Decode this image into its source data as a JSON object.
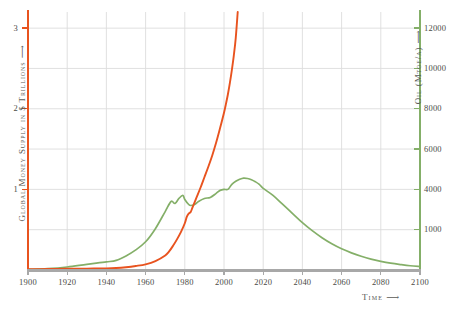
{
  "chart_data": {
    "type": "line",
    "title": "",
    "xlabel": "Time ⟶",
    "grid": true,
    "legend": "none",
    "xlim": [
      1900,
      2100
    ],
    "x_ticks": [
      "1900",
      "1920",
      "1940",
      "1960",
      "1980",
      "2000",
      "2020",
      "2040",
      "2060",
      "2080",
      "2100"
    ],
    "x_tick_values": [
      1900,
      1920,
      1940,
      1960,
      1980,
      2000,
      2020,
      2040,
      2060,
      2080,
      2100
    ],
    "axes": [
      {
        "id": "left",
        "label": "Global Money Supply in $ Trillions ⟶",
        "color": "#E8531F",
        "ylim": [
          0,
          3.2
        ],
        "ticks": [
          "1",
          "2",
          "3"
        ],
        "tick_values": [
          1,
          2,
          3
        ],
        "minor_gridlines": [
          0.5,
          1.5,
          2.5
        ]
      },
      {
        "id": "right",
        "label": "Oil (Mtoe/a) ⟶",
        "color": "#84AF68",
        "ylim": [
          0,
          12800
        ],
        "ticks": [
          "12000",
          "10000",
          "8000",
          "6000",
          "4000",
          "1000"
        ],
        "tick_values": [
          12000,
          10000,
          8000,
          6000,
          4000,
          2000
        ]
      }
    ],
    "series": [
      {
        "name": "Global Money Supply",
        "axis": "left",
        "color": "#E8531F",
        "unit": "$ Trillions",
        "clipped_at_top": true,
        "points": [
          [
            1900,
            0.01
          ],
          [
            1910,
            0.012
          ],
          [
            1920,
            0.015
          ],
          [
            1930,
            0.017
          ],
          [
            1940,
            0.02
          ],
          [
            1945,
            0.025
          ],
          [
            1950,
            0.035
          ],
          [
            1955,
            0.05
          ],
          [
            1960,
            0.07
          ],
          [
            1965,
            0.11
          ],
          [
            1970,
            0.18
          ],
          [
            1972,
            0.23
          ],
          [
            1974,
            0.3
          ],
          [
            1976,
            0.38
          ],
          [
            1978,
            0.47
          ],
          [
            1980,
            0.58
          ],
          [
            1981,
            0.66
          ],
          [
            1982,
            0.7
          ],
          [
            1983,
            0.72
          ],
          [
            1984,
            0.78
          ],
          [
            1986,
            0.9
          ],
          [
            1988,
            1.02
          ],
          [
            1990,
            1.15
          ],
          [
            1992,
            1.28
          ],
          [
            1994,
            1.42
          ],
          [
            1996,
            1.58
          ],
          [
            1998,
            1.76
          ],
          [
            2000,
            1.95
          ],
          [
            2001,
            2.06
          ],
          [
            2002,
            2.18
          ],
          [
            2003,
            2.32
          ],
          [
            2004,
            2.48
          ],
          [
            2005,
            2.66
          ],
          [
            2006,
            2.88
          ],
          [
            2007,
            3.2
          ]
        ]
      },
      {
        "name": "Oil Production",
        "axis": "right",
        "color": "#84AF68",
        "unit": "Mtoe/a",
        "points": [
          [
            1900,
            30
          ],
          [
            1910,
            70
          ],
          [
            1920,
            150
          ],
          [
            1930,
            280
          ],
          [
            1940,
            400
          ],
          [
            1945,
            480
          ],
          [
            1950,
            700
          ],
          [
            1955,
            1000
          ],
          [
            1960,
            1400
          ],
          [
            1965,
            2050
          ],
          [
            1970,
            2900
          ],
          [
            1973,
            3400
          ],
          [
            1975,
            3300
          ],
          [
            1977,
            3550
          ],
          [
            1979,
            3700
          ],
          [
            1980,
            3500
          ],
          [
            1982,
            3250
          ],
          [
            1983,
            3200
          ],
          [
            1985,
            3250
          ],
          [
            1987,
            3400
          ],
          [
            1990,
            3550
          ],
          [
            1993,
            3600
          ],
          [
            1996,
            3800
          ],
          [
            1998,
            3950
          ],
          [
            2000,
            4000
          ],
          [
            2002,
            4000
          ],
          [
            2004,
            4250
          ],
          [
            2006,
            4400
          ],
          [
            2008,
            4500
          ],
          [
            2010,
            4560
          ],
          [
            2012,
            4540
          ],
          [
            2014,
            4480
          ],
          [
            2016,
            4380
          ],
          [
            2018,
            4250
          ],
          [
            2020,
            4050
          ],
          [
            2025,
            3700
          ],
          [
            2030,
            3250
          ],
          [
            2035,
            2800
          ],
          [
            2040,
            2350
          ],
          [
            2045,
            1950
          ],
          [
            2050,
            1600
          ],
          [
            2055,
            1300
          ],
          [
            2060,
            1050
          ],
          [
            2065,
            850
          ],
          [
            2070,
            680
          ],
          [
            2075,
            540
          ],
          [
            2080,
            430
          ],
          [
            2085,
            340
          ],
          [
            2090,
            270
          ],
          [
            2095,
            210
          ],
          [
            2100,
            170
          ]
        ]
      }
    ]
  },
  "colors": {
    "money_orange": "#E8531F",
    "oil_green": "#84AF68",
    "grid": "#DCDCDC",
    "baseline_gray": "#A8A8A8",
    "text": "#4a4a46"
  }
}
